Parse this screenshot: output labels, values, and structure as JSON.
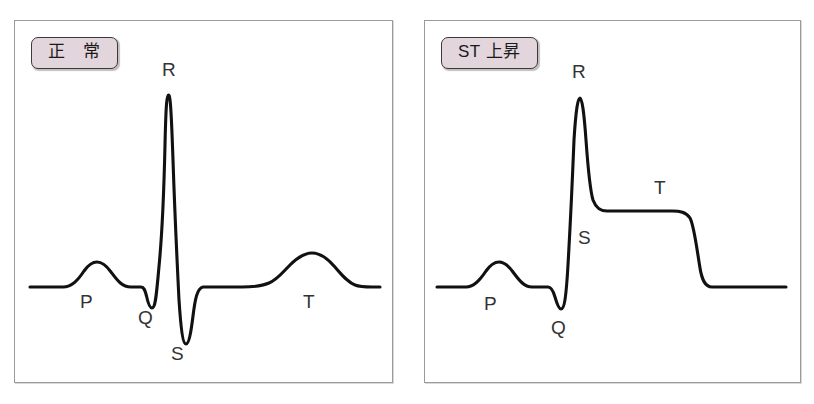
{
  "figure": {
    "type": "diagram",
    "background_color": "#ffffff",
    "trace_color": "#111111",
    "badge_fill_color": "#e3d5dc",
    "badge_border_color": "#3a3a3a",
    "frame_border_color": "#9a9a9a",
    "label_color": "#333333"
  },
  "panels": [
    {
      "id": "normal",
      "badge_label": "正　常",
      "wave_labels": [
        {
          "text": "P",
          "x": 80,
          "y": 292
        },
        {
          "text": "Q",
          "x": 138,
          "y": 308
        },
        {
          "text": "R",
          "x": 162,
          "y": 60
        },
        {
          "text": "S",
          "x": 171,
          "y": 344
        },
        {
          "text": "T",
          "x": 303,
          "y": 292
        }
      ],
      "wave_path": "M 30 287 L 63 287 C 72 287 78 280 84 271 C 89 264 93 262 97 262 C 101 262 106 265 111 272 C 117 280 122 287 131 287 L 141 287 C 144 287 145 290 146.5 296 C 148 303 150 308 152 308 C 155 308 156 300 158.5 272 C 161 244 163 231 165 145 C 166 101 167 95 168.5 95 C 170 95 171 102 173 160 C 175 220 177 260 179 300 C 181 330 183 344 186 344 C 189 344 191 332 193 316 C 195 300 197 288 203 287 L 242 287 C 254 287 262 286 269 283 C 277 280 283 272 290 265 C 298 257 305 253 312 253 C 320 253 327 258 334 266 C 341 274 347 282 355 285 C 360 287 366 287 372 287 L 380 287"
    },
    {
      "id": "st-elevation",
      "badge_label": "ST 上昇",
      "wave_labels": [
        {
          "text": "P",
          "x": 484,
          "y": 294
        },
        {
          "text": "Q",
          "x": 551,
          "y": 318
        },
        {
          "text": "R",
          "x": 572,
          "y": 62
        },
        {
          "text": "S",
          "x": 578,
          "y": 228
        },
        {
          "text": "T",
          "x": 654,
          "y": 178
        }
      ],
      "wave_path": "M 437 287 L 466 287 C 474 287 480 280 486 271 C 491 264 495 262 499 262 C 503 262 508 265 513 272 C 519 280 524 287 532 287 L 548 287 C 551 287 553 290 555 297 C 557 304 559 309 561 309 C 564 309 566 300 568 265 C 570 230 572 190 574 140 C 576 108 578 98 580 98 C 582 98 584 112 586 140 C 588 168 590 190 593 200 C 596 208 600 211 607 211 L 672 211 C 680 211 686 212 690 218 C 694 225 697 250 700 268 C 702 280 705 287 712 287 L 786 287"
    }
  ],
  "chart_data": {
    "type": "line",
    "series": [
      {
        "name": "正　常",
        "description": "Normal ECG complex with P wave, small Q dip, tall narrow R spike, deep S trough, and a rounded T wave returning to an isoelectric baseline.",
        "features": [
          {
            "label": "P",
            "amplitude": "small positive rounded bump"
          },
          {
            "label": "Q",
            "amplitude": "small negative deflection"
          },
          {
            "label": "R",
            "amplitude": "tall positive spike"
          },
          {
            "label": "S",
            "amplitude": "deep negative spike"
          },
          {
            "label": "T",
            "amplitude": "broad low positive rounded wave"
          }
        ],
        "st_segment": "isoelectric (at baseline)"
      },
      {
        "name": "ST 上昇",
        "description": "ST elevation pattern: after the R spike the trace falls only partway and forms a raised plateau above baseline which merges with the T wave before dropping back to baseline.",
        "features": [
          {
            "label": "P",
            "amplitude": "small positive rounded bump"
          },
          {
            "label": "Q",
            "amplitude": "small negative deflection"
          },
          {
            "label": "R",
            "amplitude": "tall positive spike"
          },
          {
            "label": "S",
            "amplitude": "partial descent, does not reach baseline"
          },
          {
            "label": "T",
            "amplitude": "merged with elevated plateau"
          }
        ],
        "st_segment": "elevated above baseline (plateau)"
      }
    ],
    "xlabel": "",
    "ylabel": "",
    "grid": false,
    "legend": "none"
  }
}
